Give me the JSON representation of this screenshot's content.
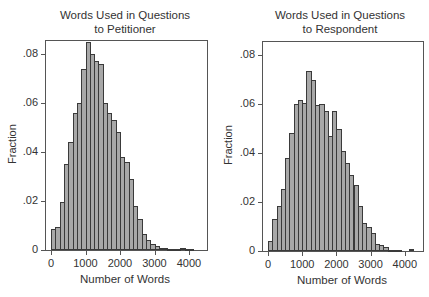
{
  "chart_data": [
    {
      "type": "bar",
      "title": "Words Used in Questions to Petitioner",
      "title_lines": [
        "Words Used in Questions",
        "to Petitioner"
      ],
      "xlabel": "Number of Words",
      "ylabel": "Fraction",
      "xlim": [
        -150,
        4450
      ],
      "ylim": [
        0,
        0.086
      ],
      "xticks": [
        0,
        1000,
        2000,
        3000,
        4000
      ],
      "xtick_labels": [
        "0",
        "1000",
        "2000",
        "3000",
        "4000"
      ],
      "yticks": [
        0,
        0.02,
        0.04,
        0.06,
        0.08
      ],
      "ytick_labels": [
        "0",
        ".02",
        ".04",
        ".06",
        ".08"
      ],
      "bin_width": 125,
      "bin_start": 0,
      "values": [
        0.0085,
        0.0095,
        0.0195,
        0.035,
        0.044,
        0.056,
        0.06,
        0.074,
        0.085,
        0.08,
        0.077,
        0.076,
        0.06,
        0.056,
        0.053,
        0.048,
        0.038,
        0.036,
        0.029,
        0.018,
        0.0125,
        0.0065,
        0.004,
        0.0025,
        0.0018,
        0.001,
        0.0008,
        0.0005,
        0.0002,
        0.0005,
        0.0008,
        0.0002,
        0.0002
      ],
      "grid": false,
      "legend": null
    },
    {
      "type": "bar",
      "title": "Words Used in Questions to Respondent",
      "title_lines": [
        "Words Used in Questions",
        "to Respondent"
      ],
      "xlabel": "Number of Words",
      "ylabel": "Fraction",
      "xlim": [
        -150,
        4550
      ],
      "ylim": [
        0,
        0.086
      ],
      "xticks": [
        0,
        1000,
        2000,
        3000,
        4000
      ],
      "xtick_labels": [
        "0",
        "1000",
        "2000",
        "3000",
        "4000"
      ],
      "yticks": [
        0,
        0.02,
        0.04,
        0.06,
        0.08
      ],
      "ytick_labels": [
        "0",
        ".02",
        ".04",
        ".06",
        ".08"
      ],
      "bin_width": 125,
      "bin_start": 0,
      "values": [
        0.004,
        0.013,
        0.0185,
        0.0255,
        0.038,
        0.048,
        0.06,
        0.0615,
        0.0605,
        0.0735,
        0.07,
        0.0595,
        0.06,
        0.057,
        0.047,
        0.057,
        0.05,
        0.041,
        0.036,
        0.031,
        0.027,
        0.0185,
        0.0115,
        0.01,
        0.0075,
        0.003,
        0.0025,
        0.0015,
        0.0005,
        0.0003,
        0.0003,
        0,
        0,
        0.0008
      ],
      "grid": false,
      "legend": null
    }
  ],
  "style": {
    "bar_fill": "#a8a8a8",
    "bar_edge": "#3a3a3a",
    "axis_color": "#555555",
    "text_color": "#333333"
  }
}
